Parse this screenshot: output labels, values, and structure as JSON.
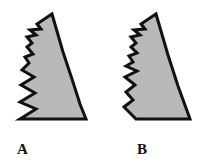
{
  "figure": {
    "background_color": "#ffffff",
    "shape_fill_color": "#b9b9b9",
    "shape_outline_color": "#111111",
    "outline_width": 3,
    "items": [
      {
        "label": "A",
        "name": "jagged-triangle-a",
        "description": "gray jagged triangle with flat horizontal base and many small notches on left edge",
        "path": "M 52 14 L 63 52 L 72 79 L 80 104 L 86 119 L 20 119 L 36 109 L 20 102 L 35 93 L 21 85 L 34 77 L 22 70 L 29 63 L 25 57 L 33 54 L 27 47 L 32 43 L 27 37 L 36 35 L 30 30 L 41 29 L 37 24 Z"
      },
      {
        "label": "B",
        "name": "jagged-triangle-b",
        "description": "gray jagged triangle with slanted lower-left base and fewer, larger notches",
        "path": "M 52 14 L 64 55 L 74 86 L 86 119 L 32 119 L 20 107 L 29 100 L 22 92 L 31 85 L 21 77 L 33 71 L 22 66 L 29 62 L 25 56 L 33 53 L 27 47 L 32 43 L 27 37 L 36 35 L 30 30 L 41 29 L 37 24 Z"
      }
    ]
  }
}
